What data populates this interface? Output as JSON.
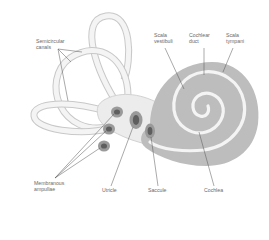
{
  "diagram": {
    "labels": {
      "semicircular_canals": "Semicircular\ncanals",
      "membranous_ampullae": "Membranous\nampullae",
      "utricle": "Utricle",
      "saccule": "Saccule",
      "cochlea": "Cochlea",
      "scala_vestibuli": "Scala\nvestibuli",
      "cochlear_duct": "Cochlear\nduct",
      "scala_tympani": "Scala\ntympani"
    },
    "colors": {
      "background": "#ffffff",
      "canal_outline": "#c8c8c8",
      "canal_fill": "#f2f2f2",
      "vestibule_fill": "#ececec",
      "cochlea_fill": "#bdbdbd",
      "cochlea_duct": "#f4f4f4",
      "ampulla_outer": "#9a9a9a",
      "ampulla_inner": "#5e5e5e",
      "leader_line": "#555555",
      "label_text": "#6a6a6a"
    }
  }
}
